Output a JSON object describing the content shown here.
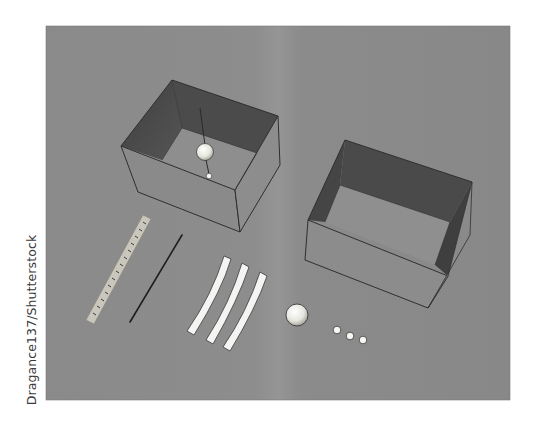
{
  "credit": "Dragance137/Shutterstock",
  "scene": {
    "description": "Apparatus laid out on a gray surface: a box with a hanging pendulum ball, an open empty box, a ruler, a thin rod, three white strips, one ball and three small beads",
    "colors": {
      "background": "#8b8b8b",
      "box_inner_wall": "#4a4a4a",
      "box_outer_face": "#8f8f8f",
      "box_floor": "#909090",
      "edge": "#2f2f2f",
      "strip": "#f4f4f2",
      "ruler": "#c9c6bb",
      "ball": "#efefe8"
    },
    "objects": [
      {
        "name": "pendulum-box",
        "label": "Box with suspended ball"
      },
      {
        "name": "open-box",
        "label": "Open box"
      },
      {
        "name": "ruler",
        "label": "Ruler"
      },
      {
        "name": "rod",
        "label": "Thin rod"
      },
      {
        "name": "strips",
        "label": "Three white strips",
        "count": 3
      },
      {
        "name": "ball",
        "label": "Ball"
      },
      {
        "name": "beads",
        "label": "Small beads",
        "count": 3
      }
    ]
  }
}
